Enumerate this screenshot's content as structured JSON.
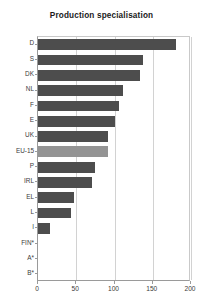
{
  "chart_data": {
    "type": "bar",
    "orientation": "horizontal",
    "title": "Production specialisation",
    "xlabel": "",
    "ylabel": "",
    "xlim": [
      0,
      200
    ],
    "xticks": [
      0,
      50,
      100,
      150,
      200
    ],
    "xtick_labels": [
      "0",
      "50",
      "100",
      "150",
      "200"
    ],
    "grid": true,
    "grid_axis": "x",
    "legend": "none",
    "categories": [
      "D",
      "S",
      "DK",
      "NL",
      "F",
      "E",
      "UK",
      "EU-15",
      "P",
      "IRL",
      "EL",
      "L",
      "I",
      "FIN*",
      "A*",
      "B*"
    ],
    "values": [
      180,
      137,
      133,
      111,
      106,
      101,
      92,
      91,
      74,
      70,
      47,
      43,
      16,
      0,
      0,
      0
    ],
    "series": [
      {
        "name": "Production specialisation",
        "values": [
          180,
          137,
          133,
          111,
          106,
          101,
          92,
          91,
          74,
          70,
          47,
          43,
          16,
          0,
          0,
          0
        ]
      }
    ],
    "highlight_category": "EU-15",
    "bar_color": "#4d4d4d",
    "highlight_color": "#949494"
  }
}
